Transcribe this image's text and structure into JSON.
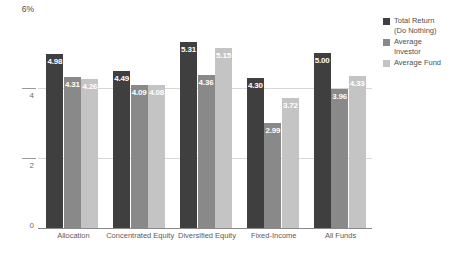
{
  "chart_data": {
    "type": "bar",
    "title": "",
    "xlabel": "",
    "ylabel": "",
    "ylim": [
      0,
      6
    ],
    "y_ticks": [
      "0",
      "2",
      "4",
      "6%"
    ],
    "grid": true,
    "legend_position": "right",
    "categories": [
      "Allocation",
      "Concentrated Equity",
      "Diversified Equity",
      "Fixed-Income",
      "All Funds"
    ],
    "series": [
      {
        "name": "Total Return (Do Nothing)",
        "color": "#3f3f3f",
        "values": [
          4.98,
          4.49,
          5.31,
          4.3,
          5.0
        ],
        "labels": [
          "4.98",
          "4.49",
          "5.31",
          "4.30",
          "5.00"
        ]
      },
      {
        "name": "Average Investor",
        "color": "#898989",
        "values": [
          4.31,
          4.09,
          4.36,
          2.99,
          3.96
        ],
        "labels": [
          "4.31",
          "4.09",
          "4.36",
          "2.99",
          "3.96"
        ]
      },
      {
        "name": "Average Fund",
        "color": "#c4c4c4",
        "values": [
          4.26,
          4.08,
          5.15,
          3.72,
          4.33
        ],
        "labels": [
          "4.26",
          "4.08",
          "5.15",
          "3.72",
          "4.33"
        ]
      }
    ]
  },
  "axis": {
    "top_label": "6%",
    "tick_4": "4",
    "tick_2": "2",
    "tick_0": "0"
  },
  "legend": {
    "items": [
      {
        "label_line1": "Total Return",
        "label_line2": "(Do Nothing)",
        "color": "#3f3f3f"
      },
      {
        "label_line1": "Average",
        "label_line2": "Investor",
        "color": "#898989"
      },
      {
        "label_line1": "Average Fund",
        "label_line2": "",
        "color": "#c4c4c4"
      }
    ]
  }
}
